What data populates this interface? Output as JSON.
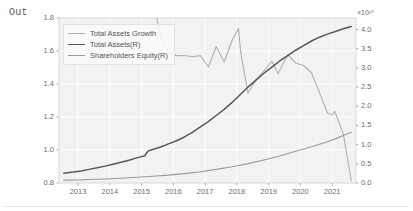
{
  "cell": {
    "prompt_label": "Out"
  },
  "chart_data": {
    "type": "line",
    "title": "",
    "xlabel": "",
    "ylabel": "",
    "xlim": [
      2012.4,
      2021.75
    ],
    "xticks": [
      2013,
      2014,
      2015,
      2016,
      2017,
      2018,
      2019,
      2020,
      2021
    ],
    "xticklabels": [
      "2013",
      "2014",
      "2015",
      "2016",
      "2017",
      "2018",
      "2019",
      "2020",
      "2021"
    ],
    "left_axis": {
      "ylim": [
        0.8,
        1.8
      ],
      "yticks": [
        0.8,
        1.0,
        1.2,
        1.4,
        1.6,
        1.8
      ],
      "yticklabels": [
        "0.8",
        "1.0",
        "1.2",
        "1.4",
        "1.6",
        "1.8"
      ]
    },
    "right_axis": {
      "ylim": [
        0.0,
        4.3
      ],
      "yticks": [
        0.0,
        0.5,
        1.0,
        1.5,
        2.0,
        2.5,
        3.0,
        3.5,
        4.0
      ],
      "yticklabels": [
        "0.0",
        "0.5",
        "1.0",
        "1.5",
        "2.0",
        "2.5",
        "3.0",
        "3.5",
        "4.0"
      ],
      "exponent_label": "×10¹⁰"
    },
    "grid": true,
    "legend_position": "upper left",
    "colors": {
      "growth": "#b0b0b0",
      "assets": "#595959",
      "equity": "#9a9a9a",
      "plot_background": "#f2f2f2",
      "grid_color": "#fdfdfd",
      "text": "#6e6e6e"
    },
    "series": [
      {
        "name": "Total Assets Growth",
        "axis": "left",
        "color": "#b0b0b0",
        "x": [
          2015.45,
          2015.6,
          2015.85,
          2016.1,
          2016.35,
          2016.6,
          2016.85,
          2017.1,
          2017.35,
          2017.6,
          2017.85,
          2018.05,
          2018.12,
          2018.35,
          2018.6,
          2018.85,
          2019.1,
          2019.3,
          2019.45,
          2019.6,
          2019.85,
          2020.1,
          2020.35,
          2020.6,
          2020.85,
          2021.0,
          2021.08,
          2021.35,
          2021.6
        ],
        "y": [
          1.82,
          1.695,
          1.588,
          1.572,
          1.573,
          1.565,
          1.572,
          1.503,
          1.627,
          1.533,
          1.665,
          1.737,
          1.592,
          1.345,
          1.425,
          1.478,
          1.538,
          1.462,
          1.522,
          1.578,
          1.527,
          1.512,
          1.468,
          1.348,
          1.224,
          1.212,
          1.235,
          1.098,
          0.815
        ]
      },
      {
        "name": "Total Assets(R)",
        "axis": "right",
        "color": "#595959",
        "x": [
          2012.55,
          2012.85,
          2013.1,
          2013.35,
          2013.6,
          2013.85,
          2014.1,
          2014.35,
          2014.6,
          2014.85,
          2015.1,
          2015.2,
          2015.35,
          2015.6,
          2015.85,
          2016.1,
          2016.35,
          2016.6,
          2016.85,
          2017.1,
          2017.35,
          2017.6,
          2017.85,
          2018.1,
          2018.35,
          2018.6,
          2018.85,
          2019.1,
          2019.35,
          2019.6,
          2019.85,
          2020.1,
          2020.35,
          2020.6,
          2020.85,
          2021.1,
          2021.35,
          2021.6
        ],
        "y": [
          0.255,
          0.285,
          0.315,
          0.355,
          0.395,
          0.44,
          0.49,
          0.54,
          0.595,
          0.655,
          0.71,
          0.83,
          0.875,
          0.94,
          1.02,
          1.1,
          1.2,
          1.32,
          1.46,
          1.6,
          1.76,
          1.92,
          2.1,
          2.3,
          2.5,
          2.68,
          2.86,
          3.02,
          3.18,
          3.32,
          3.46,
          3.58,
          3.7,
          3.8,
          3.88,
          3.95,
          4.02,
          4.08
        ]
      },
      {
        "name": "Shareholders Equity(R)",
        "axis": "right",
        "color": "#9a9a9a",
        "x": [
          2012.55,
          2013.1,
          2013.35,
          2013.85,
          2014.35,
          2014.85,
          2015.35,
          2015.85,
          2016.35,
          2016.85,
          2017.35,
          2017.85,
          2018.35,
          2018.85,
          2019.35,
          2019.85,
          2020.35,
          2020.85,
          2021.1,
          2021.35,
          2021.6
        ],
        "y": [
          0.075,
          0.082,
          0.092,
          0.105,
          0.125,
          0.148,
          0.175,
          0.205,
          0.245,
          0.295,
          0.355,
          0.425,
          0.505,
          0.6,
          0.705,
          0.825,
          0.945,
          1.075,
          1.15,
          1.235,
          1.32
        ]
      }
    ]
  }
}
